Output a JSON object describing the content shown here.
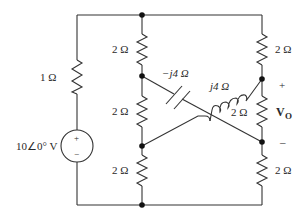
{
  "diagram": {
    "type": "circuit-schematic",
    "source": {
      "label": "10∠0° V",
      "plus": "+",
      "minus": "−"
    },
    "left_resistor": {
      "label": "1 Ω"
    },
    "middle_column": {
      "top_resistor": {
        "label": "2 Ω"
      },
      "mid_resistor": {
        "label": "2 Ω"
      },
      "bottom_resistor": {
        "label": "2 Ω"
      }
    },
    "right_column": {
      "top_resistor": {
        "label": "2 Ω"
      },
      "mid_resistor": {
        "label": "2 Ω"
      },
      "bottom_resistor": {
        "label": "2 Ω"
      }
    },
    "capacitor": {
      "label": "−j4 Ω"
    },
    "inductor": {
      "label": "j4 Ω"
    },
    "output": {
      "label": "V",
      "subscript": "O",
      "plus": "+",
      "minus": "–"
    },
    "colors": {
      "wire": "#333333",
      "node": "#111111",
      "background": "#ffffff"
    }
  }
}
